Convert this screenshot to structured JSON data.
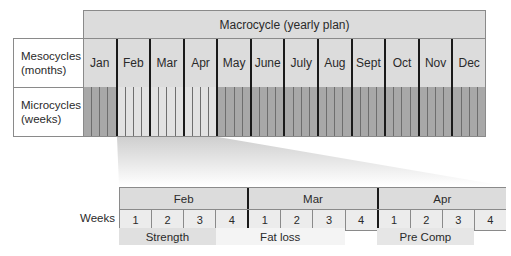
{
  "macrocycle": {
    "title": "Macrocycle (yearly plan)"
  },
  "rows": {
    "mesocycles_label": "Mesocycles\n(months)",
    "mesocycles_line1": "Mesocycles",
    "mesocycles_line2": "(months)",
    "microcycles_line1": "Microcycles",
    "microcycles_line2": "(weeks)"
  },
  "months": [
    {
      "label": "Jan",
      "highlight": false
    },
    {
      "label": "Feb",
      "highlight": true
    },
    {
      "label": "Mar",
      "highlight": true
    },
    {
      "label": "Apr",
      "highlight": true
    },
    {
      "label": "May",
      "highlight": false
    },
    {
      "label": "June",
      "highlight": false
    },
    {
      "label": "July",
      "highlight": false
    },
    {
      "label": "Aug",
      "highlight": false
    },
    {
      "label": "Sept",
      "highlight": false
    },
    {
      "label": "Oct",
      "highlight": false
    },
    {
      "label": "Nov",
      "highlight": false
    },
    {
      "label": "Dec",
      "highlight": false
    }
  ],
  "weeks_per_month": 4,
  "colors": {
    "micro_dark": "#a8a8a8",
    "micro_light": "#e2e2e2",
    "header_fill": "#dcdcdc",
    "phase_fill": "#e0e0e0"
  },
  "detail": {
    "weeks_label": "Weeks",
    "months": [
      "Feb",
      "Mar",
      "Apr"
    ],
    "weeks": [
      "1",
      "2",
      "3",
      "4",
      "1",
      "2",
      "3",
      "4",
      "1",
      "2",
      "3",
      "4"
    ],
    "phases": [
      {
        "label": "Strength",
        "start_week": 0,
        "end_week": 3,
        "shade": "#e0e0e0"
      },
      {
        "label": "Fat loss",
        "start_week": 3,
        "end_week": 7,
        "shade": "#f4f4f4"
      },
      {
        "label": "Pre Comp",
        "start_week": 8,
        "end_week": 11,
        "shade": "#e6e6e6"
      }
    ]
  }
}
